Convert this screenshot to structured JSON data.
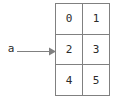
{
  "diagram": {
    "type": "array-reference-diagram",
    "background_color": "#ffffff",
    "line_color": "#808080",
    "text_color": "#2b2b2b"
  },
  "pointer": {
    "label": "a",
    "arrow_direction": "right",
    "arrow_icon_name": "arrow-right-icon"
  },
  "grid": {
    "rows": 3,
    "columns": 2,
    "cells": [
      [
        "0",
        "1"
      ],
      [
        "2",
        "3"
      ],
      [
        "4",
        "5"
      ]
    ]
  }
}
